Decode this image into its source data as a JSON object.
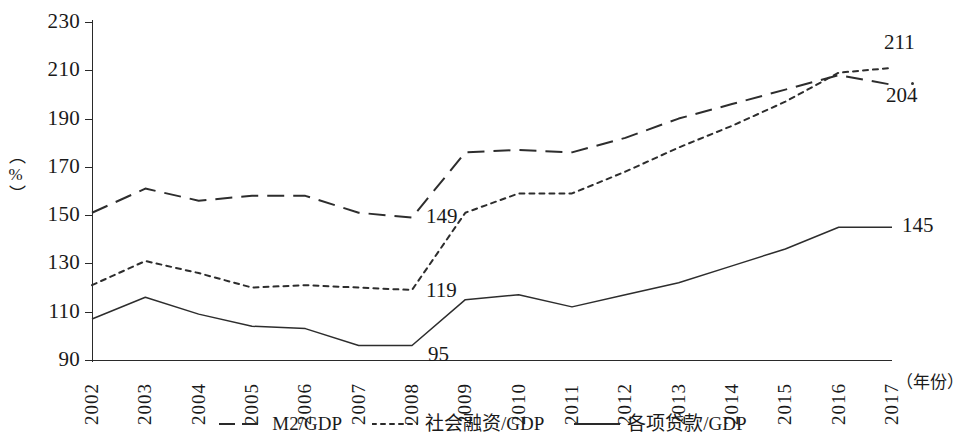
{
  "axes": {
    "y_title": "（%）",
    "x_title": "（年份）",
    "y_ticks": [
      "230",
      "210",
      "190",
      "170",
      "150",
      "130",
      "110",
      "90"
    ],
    "x_ticks": [
      "2002",
      "2003",
      "2004",
      "2005",
      "2006",
      "2007",
      "2008",
      "2009",
      "2010",
      "2011",
      "2012",
      "2013",
      "2014",
      "2015",
      "2016",
      "2017"
    ]
  },
  "legend": {
    "items": [
      {
        "label": "M2/GDP",
        "style": "dashed",
        "color": "#2a2a2a"
      },
      {
        "label": "社会融资/GDP",
        "style": "dotted",
        "color": "#2a2a2a"
      },
      {
        "label": "各项贷款/GDP",
        "style": "solid",
        "color": "#2a2a2a"
      }
    ]
  },
  "annotations": [
    {
      "text": "149",
      "series": "M2/GDP",
      "year": "2008",
      "value": 149
    },
    {
      "text": "119",
      "series": "社会融资/GDP",
      "year": "2008",
      "value": 119
    },
    {
      "text": "95",
      "series": "各项贷款/GDP",
      "year": "2008",
      "value": 95
    },
    {
      "text": "211",
      "series": "社会融资/GDP",
      "year": "2017",
      "value": 211
    },
    {
      "text": "204",
      "series": "M2/GDP",
      "year": "2017",
      "value": 204
    },
    {
      "text": "145",
      "series": "各项贷款/GDP",
      "year": "2017",
      "value": 145
    }
  ],
  "chart_data": {
    "type": "line",
    "title": "",
    "xlabel": "（年份）",
    "ylabel": "（%）",
    "xlim": [
      2002,
      2017
    ],
    "ylim": [
      90,
      230
    ],
    "ytick_step": 20,
    "grid": false,
    "legend_position": "bottom",
    "categories": [
      "2002",
      "2003",
      "2004",
      "2005",
      "2006",
      "2007",
      "2008",
      "2009",
      "2010",
      "2011",
      "2012",
      "2013",
      "2014",
      "2015",
      "2016",
      "2017"
    ],
    "series": [
      {
        "name": "M2/GDP",
        "style": "dashed",
        "values": [
          151,
          161,
          156,
          158,
          158,
          151,
          149,
          176,
          177,
          176,
          182,
          190,
          196,
          202,
          208,
          204
        ]
      },
      {
        "name": "社会融资/GDP",
        "style": "dotted",
        "values": [
          121,
          131,
          126,
          120,
          121,
          120,
          119,
          151,
          159,
          159,
          168,
          178,
          187,
          197,
          209,
          211
        ]
      },
      {
        "name": "各项贷款/GDP",
        "style": "solid",
        "values": [
          107,
          116,
          109,
          104,
          103,
          96,
          96,
          115,
          117,
          112,
          117,
          122,
          129,
          136,
          145,
          145
        ]
      }
    ]
  }
}
